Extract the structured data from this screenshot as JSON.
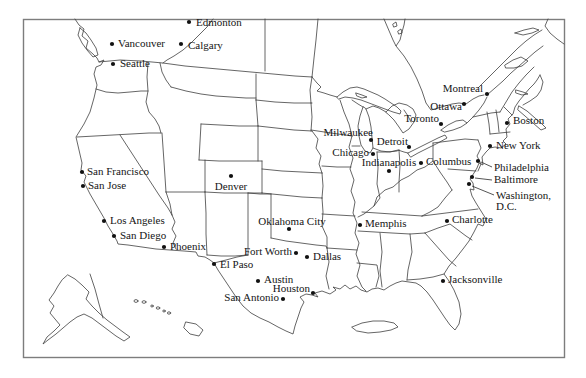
{
  "figure": {
    "kind": "outline-map",
    "region_shown": "United States and southern Canada"
  },
  "colors": {
    "background": "#ffffff",
    "map_line": "#3f3f3f",
    "frame_line": "#7d7d7d",
    "dot": "#111111",
    "label_text": "#151515"
  },
  "cities": [
    {
      "name": "Edmonton",
      "dot": {
        "x": 189,
        "y": 22
      },
      "label": {
        "x": 196,
        "y": 23,
        "anchor": "start"
      }
    },
    {
      "name": "Vancouver",
      "dot": {
        "x": 112,
        "y": 44
      },
      "label": {
        "x": 118,
        "y": 44,
        "anchor": "start"
      }
    },
    {
      "name": "Calgary",
      "dot": {
        "x": 181,
        "y": 44
      },
      "label": {
        "x": 188,
        "y": 46,
        "anchor": "start"
      }
    },
    {
      "name": "Seattle",
      "dot": {
        "x": 113,
        "y": 64
      },
      "label": {
        "x": 120,
        "y": 64,
        "anchor": "start"
      }
    },
    {
      "name": "Montreal",
      "dot": {
        "x": 487,
        "y": 94
      },
      "label": {
        "x": 483,
        "y": 89,
        "anchor": "end"
      }
    },
    {
      "name": "Ottawa",
      "dot": {
        "x": 464,
        "y": 104
      },
      "label": {
        "x": 462,
        "y": 107,
        "anchor": "end"
      }
    },
    {
      "name": "Toronto",
      "dot": {
        "x": 441,
        "y": 124
      },
      "label": {
        "x": 439,
        "y": 119,
        "anchor": "end"
      }
    },
    {
      "name": "Boston",
      "dot": {
        "x": 507,
        "y": 123
      },
      "label": {
        "x": 513,
        "y": 121,
        "anchor": "start"
      }
    },
    {
      "name": "New York",
      "dot": {
        "x": 490,
        "y": 146
      },
      "label": {
        "x": 496,
        "y": 146,
        "anchor": "start"
      }
    },
    {
      "name": "Milwaukee",
      "dot": {
        "x": 371,
        "y": 140
      },
      "label": {
        "x": 373,
        "y": 133,
        "anchor": "end"
      }
    },
    {
      "name": "Detroit",
      "dot": {
        "x": 409,
        "y": 147
      },
      "label": {
        "x": 408,
        "y": 142,
        "anchor": "end"
      }
    },
    {
      "name": "Chicago",
      "dot": {
        "x": 373,
        "y": 154
      },
      "label": {
        "x": 369,
        "y": 153,
        "anchor": "end"
      }
    },
    {
      "name": "Indianapolis",
      "dot": {
        "x": 389,
        "y": 171
      },
      "label": {
        "x": 389,
        "y": 163,
        "anchor": "middle"
      }
    },
    {
      "name": "Columbus",
      "dot": {
        "x": 421,
        "y": 163
      },
      "label": {
        "x": 426,
        "y": 162,
        "anchor": "start"
      }
    },
    {
      "name": "Philadelphia",
      "dot": {
        "x": 478,
        "y": 161
      },
      "label": {
        "x": 494,
        "y": 168,
        "anchor": "start"
      },
      "leader": {
        "x1": 492,
        "y1": 167,
        "x2": 481,
        "y2": 162
      }
    },
    {
      "name": "Baltimore",
      "dot": {
        "x": 472,
        "y": 177
      },
      "label": {
        "x": 494,
        "y": 180,
        "anchor": "start"
      },
      "leader": {
        "x1": 492,
        "y1": 180,
        "x2": 475,
        "y2": 178
      }
    },
    {
      "name": "Washington, D.C.",
      "name_lines": [
        "Washington,",
        "D.C."
      ],
      "dot": {
        "x": 469,
        "y": 184
      },
      "label": {
        "x": 496,
        "y": 196,
        "anchor": "start"
      },
      "leader": {
        "x1": 494,
        "y1": 195,
        "x2": 472,
        "y2": 186
      }
    },
    {
      "name": "Charlotte",
      "dot": {
        "x": 447,
        "y": 221
      },
      "label": {
        "x": 452,
        "y": 220,
        "anchor": "start"
      }
    },
    {
      "name": "Jacksonville",
      "dot": {
        "x": 443,
        "y": 281
      },
      "label": {
        "x": 448,
        "y": 280,
        "anchor": "start"
      }
    },
    {
      "name": "Memphis",
      "dot": {
        "x": 360,
        "y": 225
      },
      "label": {
        "x": 365,
        "y": 224,
        "anchor": "start"
      }
    },
    {
      "name": "San Francisco",
      "dot": {
        "x": 82,
        "y": 172
      },
      "label": {
        "x": 87,
        "y": 172,
        "anchor": "start"
      }
    },
    {
      "name": "San Jose",
      "dot": {
        "x": 83,
        "y": 186
      },
      "label": {
        "x": 88,
        "y": 186,
        "anchor": "start"
      }
    },
    {
      "name": "Denver",
      "dot": {
        "x": 231,
        "y": 176
      },
      "label": {
        "x": 231,
        "y": 187,
        "anchor": "middle"
      }
    },
    {
      "name": "Los Angeles",
      "dot": {
        "x": 104,
        "y": 221
      },
      "label": {
        "x": 110,
        "y": 221,
        "anchor": "start"
      }
    },
    {
      "name": "San Diego",
      "dot": {
        "x": 114,
        "y": 236
      },
      "label": {
        "x": 120,
        "y": 236,
        "anchor": "start"
      }
    },
    {
      "name": "Phoenix",
      "dot": {
        "x": 164,
        "y": 247
      },
      "label": {
        "x": 170,
        "y": 247,
        "anchor": "start"
      }
    },
    {
      "name": "El Paso",
      "dot": {
        "x": 214,
        "y": 264
      },
      "label": {
        "x": 220,
        "y": 265,
        "anchor": "start"
      }
    },
    {
      "name": "Oklahoma City",
      "dot": {
        "x": 289,
        "y": 229
      },
      "label": {
        "x": 292,
        "y": 222,
        "anchor": "middle"
      }
    },
    {
      "name": "Fort Worth",
      "dot": {
        "x": 296,
        "y": 253
      },
      "label": {
        "x": 292,
        "y": 252,
        "anchor": "end"
      }
    },
    {
      "name": "Dallas",
      "dot": {
        "x": 307,
        "y": 257
      },
      "label": {
        "x": 313,
        "y": 257,
        "anchor": "start"
      }
    },
    {
      "name": "Austin",
      "dot": {
        "x": 258,
        "y": 281
      },
      "label": {
        "x": 264,
        "y": 280,
        "anchor": "start"
      }
    },
    {
      "name": "Houston",
      "dot": {
        "x": 313,
        "y": 293
      },
      "label": {
        "x": 310,
        "y": 289,
        "anchor": "end"
      }
    },
    {
      "name": "San Antonio",
      "dot": {
        "x": 283,
        "y": 299
      },
      "label": {
        "x": 279,
        "y": 298,
        "anchor": "end"
      }
    }
  ]
}
